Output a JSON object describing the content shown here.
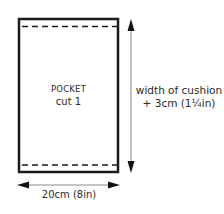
{
  "diagram": {
    "type": "sewing-pattern-piece",
    "piece": {
      "title": "POCKET",
      "instruction": "cut 1",
      "fold_lines": [
        "top-dashed-line",
        "bottom-dashed-line"
      ]
    },
    "dimensions": {
      "height": {
        "line1": "width of cushion",
        "line2": "+ 3cm (1¼in)"
      },
      "width": {
        "label": "20cm (8in)"
      }
    },
    "colors": {
      "outline": "#1a1a1a",
      "dimension_line": "#8a8a8a",
      "arrowhead": "#111111",
      "text": "#2a2a2a",
      "background": "#ffffff"
    }
  }
}
